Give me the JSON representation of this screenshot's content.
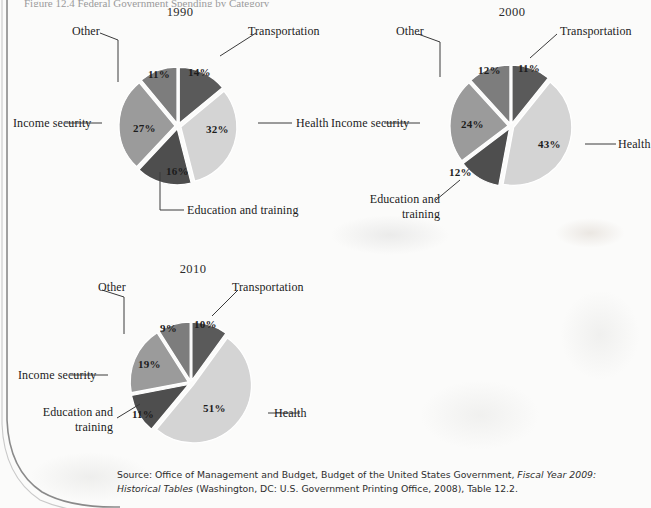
{
  "page": {
    "top_cut_text": "Figure 12.4  Federal Government Spending by Category",
    "source_parts": {
      "p1": "Source: Office of Management and Budget, Budget of the United States Government, ",
      "italic": "Fiscal Year 2009: Historical Tables",
      "p2": " (Washington, DC: U.S. Government Printing Office, 2008), Table 12.2."
    }
  },
  "colors": {
    "transportation": "#5a5a5a",
    "health": "#d4d4d4",
    "education": "#4e4e4e",
    "income_security": "#9b9b9b",
    "other": "#7d7d7d",
    "divider": "#ffffff",
    "leader": "#3a3a3a"
  },
  "chart_data": [
    {
      "type": "pie",
      "title": "1990",
      "categories": [
        "Transportation",
        "Health",
        "Education and training",
        "Income security",
        "Other"
      ],
      "values": [
        14,
        32,
        16,
        27,
        11
      ],
      "labels": [
        "14%",
        "32%",
        "16%",
        "27%",
        "11%"
      ],
      "legend": "callout-labels",
      "grid": false
    },
    {
      "type": "pie",
      "title": "2000",
      "categories": [
        "Transportation",
        "Health",
        "Education and training",
        "Income security",
        "Other"
      ],
      "values": [
        11,
        43,
        12,
        24,
        12
      ],
      "labels": [
        "11%",
        "43%",
        "12%",
        "24%",
        "12%"
      ],
      "legend": "callout-labels",
      "grid": false
    },
    {
      "type": "pie",
      "title": "2010",
      "categories": [
        "Transportation",
        "Health",
        "Education and training",
        "Income security",
        "Other"
      ],
      "values": [
        10,
        51,
        11,
        19,
        9
      ],
      "labels": [
        "10%",
        "51%",
        "11%",
        "19%",
        "9%"
      ],
      "legend": "callout-labels",
      "grid": false
    }
  ],
  "charts": {
    "c1990": {
      "title": "1990",
      "slices": {
        "transportation": "14%",
        "health": "32%",
        "education": "16%",
        "income_security": "27%",
        "other": "11%"
      },
      "cats": {
        "transportation": "Transportation",
        "health": "Health",
        "education": "Education and training",
        "income_security": "Income security",
        "other": "Other"
      }
    },
    "c2000": {
      "title": "2000",
      "slices": {
        "transportation": "11%",
        "health": "43%",
        "education": "12%",
        "income_security": "24%",
        "other": "12%"
      },
      "cats": {
        "transportation": "Transportation",
        "health": "Health",
        "education": "Education and training",
        "income_security": "Income security",
        "other": "Other"
      }
    },
    "c2010": {
      "title": "2010",
      "slices": {
        "transportation": "10%",
        "health": "51%",
        "education": "11%",
        "income_security": "19%",
        "other": "9%"
      },
      "cats": {
        "transportation": "Transportation",
        "health": "Health",
        "education": "Education and training",
        "income_security": "Income security",
        "other": "Other"
      }
    }
  }
}
